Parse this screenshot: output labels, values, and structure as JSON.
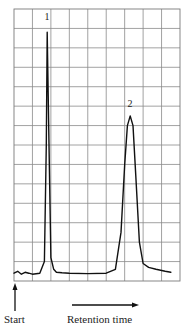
{
  "chart_data": {
    "type": "line",
    "title": "",
    "xlabel": "Retention time",
    "ylabel": "",
    "start_label": "Start",
    "grid": true,
    "grid_columns": 9,
    "grid_rows": 14,
    "x_range": [
      0,
      9
    ],
    "y_range": [
      0,
      14
    ],
    "annotations": [
      {
        "label": "1",
        "x": 1.8,
        "y": 13.0
      },
      {
        "label": "2",
        "x": 6.3,
        "y": 8.6
      }
    ],
    "series": [
      {
        "name": "detector signal",
        "x": [
          0.0,
          0.2,
          0.4,
          0.6,
          0.8,
          1.0,
          1.4,
          1.65,
          1.75,
          1.8,
          1.9,
          2.0,
          2.15,
          2.3,
          2.6,
          3.0,
          4.0,
          5.0,
          5.5,
          5.8,
          6.0,
          6.15,
          6.3,
          6.45,
          6.6,
          6.8,
          7.0,
          7.3,
          7.7,
          8.2,
          8.5
        ],
        "y": [
          0.4,
          0.5,
          0.35,
          0.45,
          0.4,
          0.35,
          0.4,
          1.0,
          7.0,
          12.8,
          7.0,
          1.2,
          0.6,
          0.45,
          0.42,
          0.4,
          0.38,
          0.4,
          0.6,
          2.5,
          6.0,
          8.0,
          8.5,
          8.0,
          5.5,
          2.0,
          0.9,
          0.7,
          0.6,
          0.5,
          0.45
        ]
      }
    ],
    "peaks": [
      {
        "id": "1",
        "retention_x": 1.8,
        "height": 12.8,
        "width": "narrow"
      },
      {
        "id": "2",
        "retention_x": 6.3,
        "height": 8.5,
        "width": "broad"
      }
    ]
  },
  "labels": {
    "start": "Start",
    "retention_time": "Retention time",
    "peak1": "1",
    "peak2": "2"
  }
}
